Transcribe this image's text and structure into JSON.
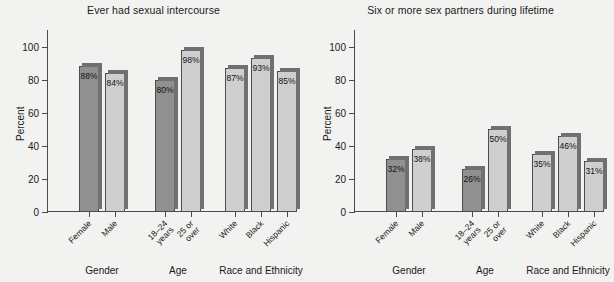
{
  "chart_data": [
    {
      "type": "bar",
      "title": "Ever had sexual intercourse",
      "xlabel": "",
      "ylabel": "Percent",
      "ylim": [
        0,
        110
      ],
      "yticks": [
        0,
        20,
        40,
        60,
        80,
        100
      ],
      "ytick_labels": [
        "0",
        "20",
        "40",
        "60",
        "80",
        "100"
      ],
      "grid": false,
      "legend": "none",
      "categories": [
        "Female",
        "Male",
        "18–24 years",
        "25 or over",
        "White",
        "Black",
        "Hispanic"
      ],
      "values": [
        88,
        84,
        80,
        98,
        87,
        93,
        85
      ],
      "data_labels": [
        "88%",
        "84%",
        "80%",
        "98%",
        "87%",
        "93%",
        "85%"
      ],
      "bar_shades": [
        "dark",
        "light",
        "dark",
        "light",
        "light",
        "light",
        "light"
      ],
      "groups": [
        {
          "label": "Gender",
          "categories": [
            "Female",
            "Male"
          ]
        },
        {
          "label": "Age",
          "categories": [
            "18–24 years",
            "25 or over"
          ]
        },
        {
          "label": "Race and Ethnicity",
          "categories": [
            "White",
            "Black",
            "Hispanic"
          ]
        }
      ]
    },
    {
      "type": "bar",
      "title": "Six or more sex partners during lifetime",
      "xlabel": "",
      "ylabel": "Percent",
      "ylim": [
        0,
        110
      ],
      "yticks": [
        0,
        20,
        40,
        60,
        80,
        100
      ],
      "ytick_labels": [
        "0",
        "20",
        "40",
        "60",
        "80",
        "100"
      ],
      "grid": false,
      "legend": "none",
      "categories": [
        "Female",
        "Male",
        "18–24 years",
        "25 or over",
        "White",
        "Black",
        "Hispanic"
      ],
      "values": [
        32,
        38,
        26,
        50,
        35,
        46,
        31
      ],
      "data_labels": [
        "32%",
        "38%",
        "26%",
        "50%",
        "35%",
        "46%",
        "31%"
      ],
      "bar_shades": [
        "dark",
        "light",
        "dark",
        "light",
        "light",
        "light",
        "light"
      ],
      "groups": [
        {
          "label": "Gender",
          "categories": [
            "Female",
            "Male"
          ]
        },
        {
          "label": "Age",
          "categories": [
            "18–24 years",
            "25 or over"
          ]
        },
        {
          "label": "Race and Ethnicity",
          "categories": [
            "White",
            "Black",
            "Hispanic"
          ]
        }
      ]
    }
  ],
  "colors": {
    "background": "#f2f2f0",
    "bar_dark": "#909090",
    "bar_light": "#cfcfcf",
    "bar_shadow": "#707070",
    "bar_outline": "#4d4d4d",
    "axis": "#4a4a4a",
    "text": "#1a1a1a"
  }
}
